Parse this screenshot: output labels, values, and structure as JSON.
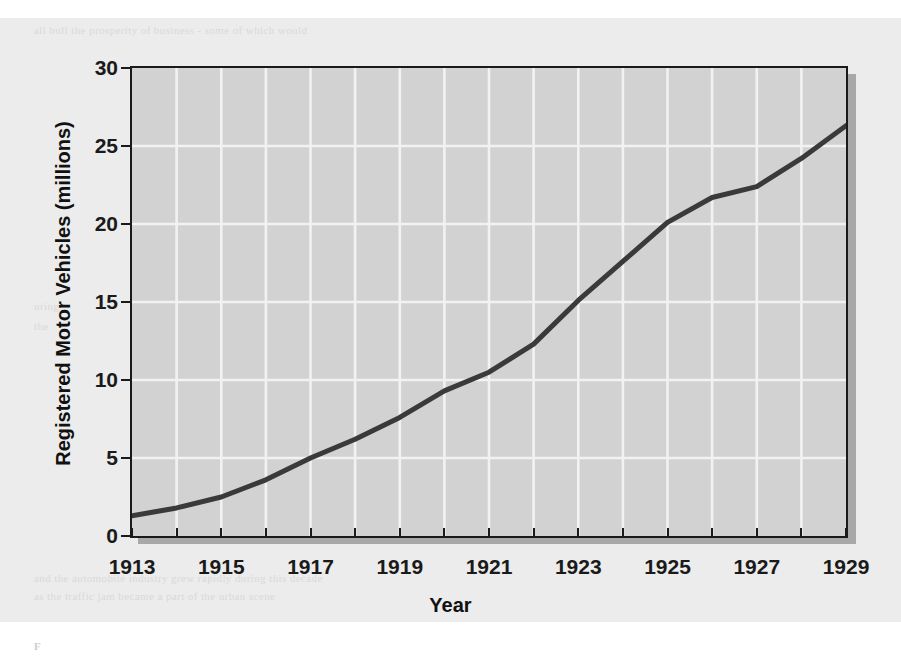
{
  "page": {
    "background_color": "#ececec",
    "ghost_text_top": "all bull the  prosperity  of  business  -  some of which  would",
    "ghost_text_left_1": "uring",
    "ghost_text_left_2": "the",
    "ghost_text_bottom_1": "and  the  automobile  industry  grew  rapidly  during  this  decade",
    "ghost_text_bottom_2": "as  the  traffic  jam  became  a  part  of  the  urban  scene",
    "ghost_caption": "F"
  },
  "chart_data": {
    "type": "line",
    "title": "",
    "xlabel": "Year",
    "ylabel": "Registered Motor Vehicles (millions)",
    "xlim": [
      1913,
      1929
    ],
    "ylim": [
      0,
      30
    ],
    "xticks": [
      1913,
      1915,
      1917,
      1919,
      1921,
      1923,
      1925,
      1927,
      1929
    ],
    "yticks": [
      0,
      5,
      10,
      15,
      20,
      25,
      30
    ],
    "xtick_labels": [
      "1913",
      "1915",
      "1917",
      "1919",
      "1921",
      "1923",
      "1925",
      "1927",
      "1929"
    ],
    "ytick_labels": [
      "0",
      "5",
      "10",
      "15",
      "20",
      "25",
      "30"
    ],
    "grid": true,
    "grid_color": "#f2f2f2",
    "plot_background": "#d2d2d2",
    "line_color": "#3a3a3a",
    "legend": "none",
    "x": [
      1913,
      1914,
      1915,
      1916,
      1917,
      1918,
      1919,
      1920,
      1921,
      1922,
      1923,
      1924,
      1925,
      1926,
      1927,
      1928,
      1929
    ],
    "values": [
      1.3,
      1.8,
      2.5,
      3.6,
      5.0,
      6.2,
      7.6,
      9.3,
      10.5,
      12.3,
      15.1,
      17.6,
      20.1,
      21.7,
      22.4,
      24.2,
      26.3
    ],
    "series": [
      {
        "name": "Registered Motor Vehicles",
        "values": [
          1.3,
          1.8,
          2.5,
          3.6,
          5.0,
          6.2,
          7.6,
          9.3,
          10.5,
          12.3,
          15.1,
          17.6,
          20.1,
          21.7,
          22.4,
          24.2,
          26.3
        ]
      }
    ]
  }
}
